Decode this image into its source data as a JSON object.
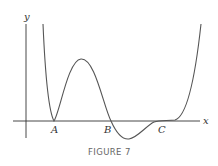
{
  "figure": {
    "caption": "FIGURE 7",
    "axes": {
      "x_label": "x",
      "y_label": "y"
    },
    "points": [
      {
        "label": "A",
        "description": "local minimum touching x-axis"
      },
      {
        "label": "B",
        "description": "curve crosses x-axis going downward"
      },
      {
        "label": "C",
        "description": "horizontal inflection point on x-axis"
      }
    ],
    "colors": {
      "curve": "#555555",
      "axes": "#333333",
      "caption": "#666666"
    }
  }
}
